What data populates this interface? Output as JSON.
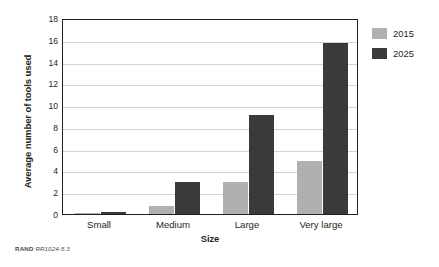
{
  "chart_data": {
    "type": "bar",
    "title": "",
    "xlabel": "Size",
    "ylabel": "Average number of tools used",
    "categories": [
      "Small",
      "Medium",
      "Large",
      "Very large"
    ],
    "series": [
      {
        "name": "2015",
        "color": "#b0b0b0",
        "values": [
          0.02,
          0.7,
          2.9,
          4.9
        ]
      },
      {
        "name": "2025",
        "color": "#3a3a3a",
        "values": [
          0.15,
          2.95,
          9.1,
          15.75
        ]
      }
    ],
    "ylim": [
      0,
      18
    ],
    "yticks": [
      0,
      2,
      4,
      6,
      8,
      10,
      12,
      14,
      16,
      18
    ],
    "grid": "horizontal",
    "legend_position": "right"
  },
  "footer": {
    "source": "RAND",
    "document_id": "RR1024-5.3"
  }
}
